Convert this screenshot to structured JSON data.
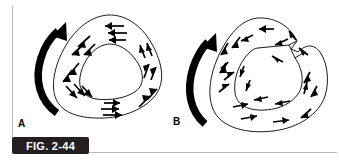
{
  "figure": {
    "caption_label": "FIG. 2-44",
    "panels": [
      {
        "id": "A",
        "letter": "A"
      },
      {
        "id": "B",
        "letter": "B"
      }
    ],
    "colors": {
      "ink": "#000000",
      "rule": "#b9b9b9",
      "caption_background": "#231f20",
      "caption_text": "#ffffff",
      "page_background": "#ffffff"
    },
    "diagram_a": {
      "name": "intact-rounded-triangular-ring",
      "description": "Rounded triangular ring with concentric inner opening and counterclockwise flow arrows",
      "rotation_arrow": "counterclockwise-curved-arrow",
      "flow_direction": "counterclockwise",
      "arrow_count": 22
    },
    "diagram_b": {
      "name": "notched-rounded-triangular-ring",
      "description": "Rounded triangular ring with a radial slit in the upper right wall and disordered flow arrows",
      "rotation_arrow": "counterclockwise-curved-arrow",
      "flow_direction": "disordered",
      "arrow_count": 24,
      "has_slit": true
    }
  }
}
